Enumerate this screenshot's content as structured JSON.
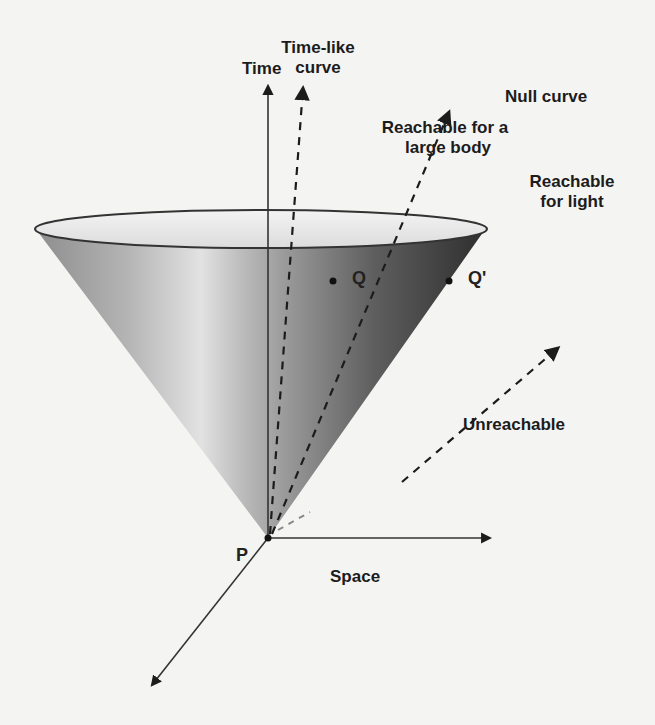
{
  "figure": {
    "axes": {
      "time_label": "Time",
      "space_label": "Space"
    },
    "points": {
      "origin": "P",
      "q": "Q",
      "q_prime": "Q'"
    },
    "annotations": {
      "timelike_curve": "Time-like\ncurve",
      "timelike_curve_line1": "Time-like",
      "timelike_curve_line2": "curve",
      "reachable_large_body_line1": "Reachable for a",
      "reachable_large_body_line2": "large body",
      "null_curve": "Null curve",
      "reachable_light_line1": "Reachable",
      "reachable_light_line2": "for light",
      "unreachable": "Unreachable"
    },
    "colors": {
      "background": "#f4f4f2",
      "ink": "#1c1c1c",
      "cone_light": "#e6e6e6",
      "cone_mid": "#9a9a9a",
      "cone_dark": "#3a3a3a"
    }
  }
}
